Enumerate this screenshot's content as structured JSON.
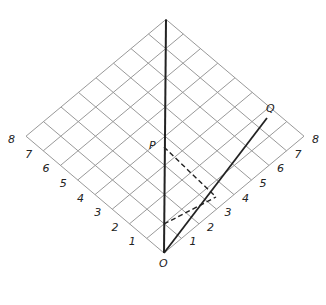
{
  "diagram": {
    "title": "",
    "axis_labels": {
      "left": [
        "1",
        "2",
        "3",
        "4",
        "5",
        "6",
        "7",
        "8"
      ],
      "right": [
        "1",
        "2",
        "3",
        "4",
        "5",
        "6",
        "7",
        "8"
      ]
    },
    "points": {
      "origin": "O",
      "p": "P",
      "q": "Q"
    },
    "colors": {
      "grid": "#999999",
      "line": "#222222"
    }
  }
}
